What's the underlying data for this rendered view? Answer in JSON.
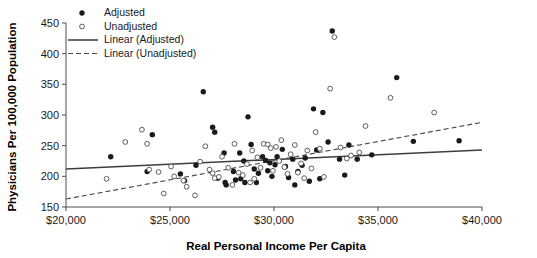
{
  "chart_data": {
    "type": "scatter",
    "title": "",
    "xlabel": "Real Personal Income Per Capita",
    "ylabel": "Physicians Per 100,000 Population",
    "xlim": [
      20000,
      40000
    ],
    "ylim": [
      150,
      450
    ],
    "grid": false,
    "legend_position": "top-left",
    "xticks": [
      20000,
      25000,
      30000,
      35000,
      40000
    ],
    "xticklabels": [
      "$20,000",
      "$25,000",
      "$30,000",
      "$35,000",
      "$40,000"
    ],
    "yticks": [
      150,
      200,
      250,
      300,
      350,
      400,
      450
    ],
    "yticklabels": [
      "150",
      "200",
      "250",
      "300",
      "350",
      "400",
      "450"
    ],
    "legend": [
      {
        "label": "Adjusted",
        "marker": "filled-circle",
        "type": "scatter"
      },
      {
        "label": "Unadjusted",
        "marker": "open-circle",
        "type": "scatter"
      },
      {
        "label": "Linear (Adjusted)",
        "marker": "solid-line",
        "type": "line"
      },
      {
        "label": "Linear (Unadjusted)",
        "marker": "dashed-line",
        "type": "line"
      }
    ],
    "series": [
      {
        "name": "Adjusted",
        "marker": "filled-circle",
        "color": "#1a1a1a",
        "points": [
          [
            22150,
            232
          ],
          [
            23900,
            208
          ],
          [
            24150,
            268
          ],
          [
            25500,
            204
          ],
          [
            25700,
            193
          ],
          [
            26250,
            218
          ],
          [
            26600,
            338
          ],
          [
            27050,
            280
          ],
          [
            27150,
            272
          ],
          [
            27300,
            197
          ],
          [
            27600,
            238
          ],
          [
            27650,
            190
          ],
          [
            27700,
            186
          ],
          [
            28050,
            208
          ],
          [
            28150,
            194
          ],
          [
            28350,
            238
          ],
          [
            28400,
            196
          ],
          [
            28550,
            225
          ],
          [
            28600,
            190
          ],
          [
            28750,
            297
          ],
          [
            28900,
            252
          ],
          [
            29050,
            212
          ],
          [
            29150,
            190
          ],
          [
            29250,
            205
          ],
          [
            29450,
            232
          ],
          [
            29600,
            226
          ],
          [
            29700,
            209
          ],
          [
            29800,
            222
          ],
          [
            29900,
            200
          ],
          [
            30050,
            219
          ],
          [
            30150,
            232
          ],
          [
            30400,
            244
          ],
          [
            30550,
            216
          ],
          [
            30700,
            198
          ],
          [
            30900,
            228
          ],
          [
            31000,
            186
          ],
          [
            31150,
            208
          ],
          [
            31350,
            218
          ],
          [
            31500,
            230
          ],
          [
            31700,
            192
          ],
          [
            31900,
            310
          ],
          [
            32050,
            243
          ],
          [
            32200,
            196
          ],
          [
            32350,
            304
          ],
          [
            32600,
            256
          ],
          [
            32800,
            437
          ],
          [
            33150,
            228
          ],
          [
            33400,
            202
          ],
          [
            33600,
            251
          ],
          [
            34000,
            228
          ],
          [
            34700,
            235
          ],
          [
            35900,
            361
          ],
          [
            36700,
            257
          ],
          [
            38900,
            258
          ]
        ]
      },
      {
        "name": "Unadjusted",
        "marker": "open-circle",
        "color": "#ffffff",
        "points": [
          [
            21950,
            196
          ],
          [
            22850,
            256
          ],
          [
            23650,
            276
          ],
          [
            23900,
            253
          ],
          [
            24000,
            211
          ],
          [
            24450,
            207
          ],
          [
            24700,
            172
          ],
          [
            25050,
            216
          ],
          [
            25200,
            200
          ],
          [
            25650,
            193
          ],
          [
            25800,
            183
          ],
          [
            26200,
            169
          ],
          [
            26450,
            224
          ],
          [
            26700,
            249
          ],
          [
            26900,
            211
          ],
          [
            27050,
            205
          ],
          [
            27150,
            197
          ],
          [
            27350,
            199
          ],
          [
            27500,
            232
          ],
          [
            27800,
            214
          ],
          [
            28000,
            186
          ],
          [
            28100,
            253
          ],
          [
            28300,
            206
          ],
          [
            28500,
            202
          ],
          [
            28700,
            220
          ],
          [
            28850,
            190
          ],
          [
            28950,
            242
          ],
          [
            29050,
            196
          ],
          [
            29200,
            231
          ],
          [
            29350,
            214
          ],
          [
            29500,
            253
          ],
          [
            29700,
            252
          ],
          [
            29850,
            246
          ],
          [
            29950,
            209
          ],
          [
            30100,
            248
          ],
          [
            30250,
            225
          ],
          [
            30350,
            259
          ],
          [
            30500,
            215
          ],
          [
            30650,
            204
          ],
          [
            30800,
            236
          ],
          [
            31000,
            251
          ],
          [
            31150,
            206
          ],
          [
            31300,
            221
          ],
          [
            31450,
            197
          ],
          [
            31600,
            242
          ],
          [
            31800,
            213
          ],
          [
            32000,
            272
          ],
          [
            32200,
            245
          ],
          [
            32400,
            199
          ],
          [
            32700,
            343
          ],
          [
            32900,
            427
          ],
          [
            33200,
            247
          ],
          [
            33500,
            229
          ],
          [
            33700,
            234
          ],
          [
            34100,
            239
          ],
          [
            34400,
            282
          ],
          [
            35600,
            328
          ],
          [
            37700,
            304
          ]
        ]
      }
    ],
    "trendlines": [
      {
        "name": "Linear (Adjusted)",
        "style": "solid",
        "x0": 20000,
        "y0": 212,
        "x1": 40000,
        "y1": 243
      },
      {
        "name": "Linear (Unadjusted)",
        "style": "dashed",
        "x0": 20000,
        "y0": 163,
        "x1": 40000,
        "y1": 288
      }
    ]
  }
}
